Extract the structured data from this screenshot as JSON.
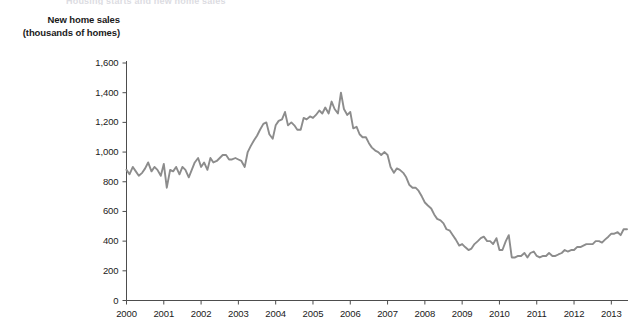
{
  "clipped_header": "Housing starts and new home sales",
  "axis_title_line1": "New home sales",
  "axis_title_line2": "(thousands of homes)",
  "colors": {
    "line": "#8c8c8c",
    "axis": "#4d4d4d",
    "text": "#1a1a1a"
  },
  "chart_data": {
    "type": "line",
    "title": "",
    "subtitle": "",
    "xlabel": "",
    "ylabel": "New home sales (thousands of homes)",
    "ylim": [
      0,
      1600
    ],
    "xlim": [
      2000,
      2013.42
    ],
    "grid": false,
    "legend": false,
    "ytick_labels": [
      "0",
      "200",
      "400",
      "600",
      "800",
      "1,000",
      "1,200",
      "1,400",
      "1,600"
    ],
    "ytick_values": [
      0,
      200,
      400,
      600,
      800,
      1000,
      1200,
      1400,
      1600
    ],
    "xtick_labels": [
      "2000",
      "2001",
      "2002",
      "2003",
      "2004",
      "2005",
      "2006",
      "2007",
      "2008",
      "2009",
      "2010",
      "2011",
      "2012",
      "2013"
    ],
    "xtick_values": [
      2000,
      2001,
      2002,
      2003,
      2004,
      2005,
      2006,
      2007,
      2008,
      2009,
      2010,
      2011,
      2012,
      2013
    ],
    "series": [
      {
        "name": "New home sales",
        "color": "#8c8c8c",
        "x": [
          2000.0,
          2000.08,
          2000.17,
          2000.25,
          2000.33,
          2000.42,
          2000.5,
          2000.58,
          2000.67,
          2000.75,
          2000.83,
          2000.92,
          2001.0,
          2001.08,
          2001.17,
          2001.25,
          2001.33,
          2001.42,
          2001.5,
          2001.58,
          2001.67,
          2001.75,
          2001.83,
          2001.92,
          2002.0,
          2002.08,
          2002.17,
          2002.25,
          2002.33,
          2002.42,
          2002.5,
          2002.58,
          2002.67,
          2002.75,
          2002.83,
          2002.92,
          2003.0,
          2003.08,
          2003.17,
          2003.25,
          2003.33,
          2003.42,
          2003.5,
          2003.58,
          2003.67,
          2003.75,
          2003.83,
          2003.92,
          2004.0,
          2004.08,
          2004.17,
          2004.25,
          2004.33,
          2004.42,
          2004.5,
          2004.58,
          2004.67,
          2004.75,
          2004.83,
          2004.92,
          2005.0,
          2005.08,
          2005.17,
          2005.25,
          2005.33,
          2005.42,
          2005.5,
          2005.58,
          2005.67,
          2005.75,
          2005.83,
          2005.92,
          2006.0,
          2006.08,
          2006.17,
          2006.25,
          2006.33,
          2006.42,
          2006.5,
          2006.58,
          2006.67,
          2006.75,
          2006.83,
          2006.92,
          2007.0,
          2007.08,
          2007.17,
          2007.25,
          2007.33,
          2007.42,
          2007.5,
          2007.58,
          2007.67,
          2007.75,
          2007.83,
          2007.92,
          2008.0,
          2008.08,
          2008.17,
          2008.25,
          2008.33,
          2008.42,
          2008.5,
          2008.58,
          2008.67,
          2008.75,
          2008.83,
          2008.92,
          2009.0,
          2009.08,
          2009.17,
          2009.25,
          2009.33,
          2009.42,
          2009.5,
          2009.58,
          2009.67,
          2009.75,
          2009.83,
          2009.92,
          2010.0,
          2010.08,
          2010.17,
          2010.25,
          2010.33,
          2010.42,
          2010.5,
          2010.58,
          2010.67,
          2010.75,
          2010.83,
          2010.92,
          2011.0,
          2011.08,
          2011.17,
          2011.25,
          2011.33,
          2011.42,
          2011.5,
          2011.58,
          2011.67,
          2011.75,
          2011.83,
          2011.92,
          2012.0,
          2012.08,
          2012.17,
          2012.25,
          2012.33,
          2012.42,
          2012.5,
          2012.58,
          2012.67,
          2012.75,
          2012.83,
          2012.92,
          2013.0,
          2013.08,
          2013.17,
          2013.25,
          2013.33,
          2013.42
        ],
        "values": [
          880,
          850,
          900,
          870,
          840,
          860,
          890,
          930,
          870,
          900,
          880,
          840,
          920,
          760,
          880,
          870,
          900,
          850,
          900,
          880,
          830,
          880,
          930,
          960,
          900,
          930,
          880,
          960,
          930,
          940,
          960,
          980,
          980,
          950,
          950,
          960,
          950,
          940,
          900,
          1000,
          1040,
          1080,
          1110,
          1150,
          1190,
          1200,
          1120,
          1090,
          1180,
          1210,
          1220,
          1270,
          1180,
          1200,
          1180,
          1150,
          1150,
          1230,
          1220,
          1240,
          1230,
          1250,
          1280,
          1260,
          1300,
          1260,
          1340,
          1290,
          1260,
          1400,
          1290,
          1250,
          1270,
          1160,
          1170,
          1120,
          1100,
          1100,
          1060,
          1030,
          1010,
          1000,
          980,
          1000,
          980,
          900,
          860,
          890,
          880,
          860,
          830,
          780,
          760,
          760,
          740,
          700,
          660,
          640,
          620,
          580,
          550,
          540,
          520,
          480,
          470,
          440,
          410,
          370,
          380,
          360,
          340,
          350,
          380,
          400,
          420,
          430,
          400,
          400,
          380,
          420,
          340,
          340,
          400,
          440,
          290,
          290,
          300,
          300,
          320,
          290,
          320,
          330,
          300,
          290,
          300,
          300,
          320,
          300,
          300,
          310,
          320,
          340,
          330,
          340,
          340,
          360,
          360,
          370,
          380,
          380,
          380,
          400,
          400,
          390,
          410,
          430,
          450,
          450,
          460,
          440,
          480,
          480
        ]
      }
    ]
  }
}
